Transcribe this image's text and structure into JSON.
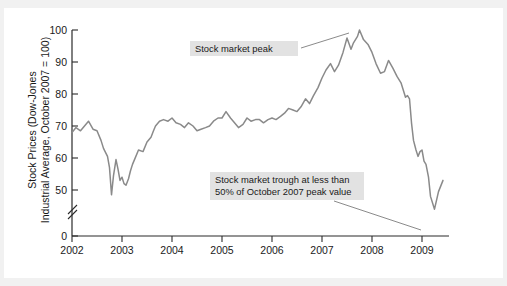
{
  "chart_data": {
    "type": "line",
    "title": "",
    "xlabel": "",
    "ylabel_line1": "Stock Prices (Dow-Jones",
    "ylabel_line2": "Industrial Average, October 2007 = 100)",
    "x_tick_labels": [
      "2002",
      "2003",
      "2004",
      "2005",
      "2006",
      "2007",
      "2008",
      "2009"
    ],
    "y_tick_labels": [
      "0",
      "50",
      "60",
      "70",
      "80",
      "90",
      "100"
    ],
    "xlim": [
      2002.0,
      2009.45
    ],
    "ylim": [
      45,
      100
    ],
    "y_axis_break": true,
    "y_axis_break_between": [
      0,
      45
    ],
    "grid": false,
    "legend": "none",
    "line_color": "#8a8a8a",
    "series": [
      {
        "name": "Dow-Jones Industrial Average (October 2007 = 100)",
        "x": [
          2002.0,
          2002.08,
          2002.17,
          2002.25,
          2002.33,
          2002.42,
          2002.5,
          2002.58,
          2002.63,
          2002.71,
          2002.75,
          2002.79,
          2002.83,
          2002.88,
          2002.92,
          2002.96,
          2003.0,
          2003.04,
          2003.08,
          2003.13,
          2003.17,
          2003.21,
          2003.25,
          2003.33,
          2003.42,
          2003.5,
          2003.58,
          2003.63,
          2003.67,
          2003.75,
          2003.83,
          2003.92,
          2004.0,
          2004.08,
          2004.17,
          2004.25,
          2004.33,
          2004.42,
          2004.5,
          2004.58,
          2004.67,
          2004.75,
          2004.83,
          2004.92,
          2005.0,
          2005.08,
          2005.17,
          2005.25,
          2005.33,
          2005.42,
          2005.5,
          2005.58,
          2005.67,
          2005.75,
          2005.83,
          2005.92,
          2006.0,
          2006.08,
          2006.17,
          2006.25,
          2006.33,
          2006.42,
          2006.5,
          2006.58,
          2006.67,
          2006.75,
          2006.83,
          2006.92,
          2007.0,
          2007.08,
          2007.17,
          2007.25,
          2007.33,
          2007.42,
          2007.5,
          2007.58,
          2007.63,
          2007.71,
          2007.75,
          2007.83,
          2007.92,
          2008.0,
          2008.08,
          2008.17,
          2008.25,
          2008.33,
          2008.42,
          2008.5,
          2008.58,
          2008.67,
          2008.71,
          2008.75,
          2008.79,
          2008.83,
          2008.88,
          2008.92,
          2008.96,
          2009.0,
          2009.04,
          2009.08,
          2009.13,
          2009.17,
          2009.25,
          2009.33,
          2009.42
        ],
        "y": [
          68.0,
          69.5,
          68.5,
          70.0,
          71.5,
          69.0,
          68.5,
          65.5,
          63.0,
          60.5,
          57.0,
          48.5,
          54.5,
          59.5,
          56.5,
          53.0,
          54.0,
          52.0,
          51.5,
          53.5,
          56.0,
          58.0,
          59.5,
          62.5,
          62.0,
          65.0,
          66.5,
          68.5,
          70.0,
          71.5,
          72.0,
          71.5,
          72.5,
          71.0,
          70.5,
          69.5,
          71.0,
          70.0,
          68.5,
          69.0,
          69.5,
          70.0,
          71.5,
          72.5,
          72.5,
          74.5,
          72.5,
          71.0,
          69.5,
          70.5,
          72.5,
          71.5,
          72.0,
          72.0,
          71.0,
          72.0,
          72.5,
          72.0,
          73.0,
          74.0,
          75.5,
          75.0,
          74.5,
          76.0,
          78.5,
          77.0,
          79.5,
          82.0,
          85.0,
          87.5,
          89.5,
          87.0,
          89.0,
          93.0,
          97.5,
          94.0,
          96.0,
          98.0,
          100.0,
          97.0,
          95.5,
          93.0,
          89.5,
          86.5,
          87.0,
          90.5,
          88.0,
          85.5,
          83.5,
          79.0,
          79.5,
          78.5,
          71.0,
          65.5,
          62.5,
          60.5,
          62.0,
          62.5,
          59.0,
          58.0,
          54.0,
          48.0,
          44.0,
          49.5,
          53.0
        ]
      }
    ],
    "annotations": [
      {
        "id": "peak-annotation",
        "text": "Stock market peak",
        "points_to_x": 2007.75,
        "points_to_y": 100
      },
      {
        "id": "trough-annotation",
        "text_line1": "Stock market trough at less than",
        "text_line2": "50% of October 2007 peak value",
        "points_to_x": 2009.17,
        "points_to_y": 44
      }
    ]
  }
}
